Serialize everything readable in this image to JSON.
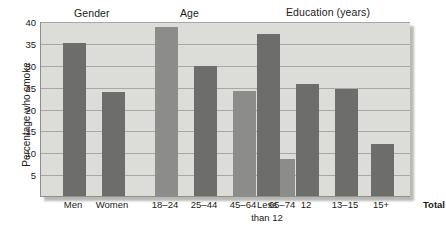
{
  "chart_data": {
    "type": "bar",
    "title": "",
    "subtitle": "",
    "xlabel": "",
    "ylabel": "Percentage who smoke",
    "ylim": [
      0,
      40
    ],
    "yticks": [
      5,
      10,
      15,
      20,
      25,
      30,
      35,
      40
    ],
    "ytick_labels": [
      "5",
      "10",
      "15",
      "20",
      "25",
      "30",
      "35",
      "40"
    ],
    "grid": true,
    "legend": "none",
    "categories": [
      "Men",
      "Women",
      "18–24",
      "25–44",
      "45–64",
      "65–74",
      "Less\nthan 12",
      "12",
      "13–15",
      "15+",
      "Total"
    ],
    "values": [
      35,
      23.7,
      38.7,
      29.7,
      23.9,
      8.4,
      37,
      25.5,
      24.4,
      12,
      28
    ],
    "group_headers": [
      {
        "label": "Gender",
        "categories": [
          "Men",
          "Women"
        ]
      },
      {
        "label": "Age",
        "categories": [
          "18–24",
          "25–44",
          "45–64",
          "65–74"
        ]
      },
      {
        "label": "Education (years)",
        "categories": [
          "Less than 12",
          "12",
          "13–15",
          "15+"
        ]
      }
    ],
    "bars": [
      {
        "label": "Men",
        "label_lines": "Men",
        "value": 35,
        "group": "Gender",
        "x_center": 33,
        "width": 23,
        "shade": "dark",
        "bold_label": false
      },
      {
        "label": "Women",
        "label_lines": "Women",
        "value": 23.7,
        "group": "Gender",
        "x_center": 72,
        "width": 23,
        "shade": "dark",
        "bold_label": false
      },
      {
        "label": "18–24",
        "label_lines": "18–24",
        "value": 38.7,
        "group": "Age",
        "x_center": 125,
        "width": 23,
        "shade": "light",
        "bold_label": false
      },
      {
        "label": "25–44",
        "label_lines": "25–44",
        "value": 29.7,
        "group": "Age",
        "x_center": 164,
        "width": 23,
        "shade": "dark",
        "bold_label": false
      },
      {
        "label": "45–64",
        "label_lines": "45–64",
        "value": 23.9,
        "group": "Age",
        "x_center": 203,
        "width": 23,
        "shade": "light",
        "bold_label": false
      },
      {
        "label": "65–74",
        "label_lines": "65–74",
        "value": 8.4,
        "group": "Age",
        "x_center": 242,
        "width": 23,
        "shade": "light",
        "bold_label": false
      },
      {
        "label": "Less than 12",
        "label_lines": "Less\nthan 12",
        "value": 37,
        "group": "Education (years)",
        "x_center": 227,
        "width": 23,
        "shade": "dark",
        "bold_label": false
      },
      {
        "label": "12",
        "label_lines": "12",
        "value": 25.5,
        "group": "Education (years)",
        "x_center": 266,
        "width": 23,
        "shade": "dark",
        "bold_label": false
      },
      {
        "label": "13–15",
        "label_lines": "13–15",
        "value": 24.4,
        "group": "Education (years)",
        "x_center": 305,
        "width": 23,
        "shade": "dark",
        "bold_label": false
      },
      {
        "label": "15+",
        "label_lines": "15+",
        "value": 12,
        "group": "Education (years)",
        "x_center": 341,
        "width": 23,
        "shade": "dark",
        "bold_label": false
      },
      {
        "label": "Total",
        "label_lines": "Total",
        "value": 28,
        "group": "Total",
        "x_center": 394,
        "width": 23,
        "shade": "dark",
        "bold_label": true
      }
    ],
    "colors": {
      "bar_dark": "#6d6d6b",
      "bar_light": "#8c8c8a",
      "plot_background": "#dcdcd8",
      "gridline": "#a9a9a4",
      "axis": "#8e8e8a",
      "text": "#1a1a1a",
      "page_background": "#ffffff"
    }
  }
}
